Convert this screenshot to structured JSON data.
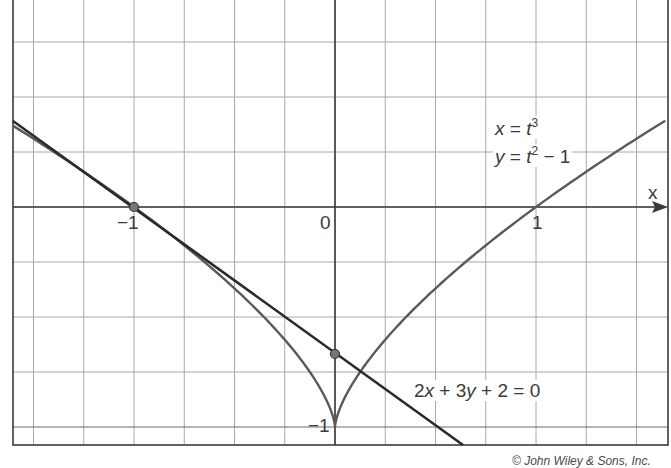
{
  "chart_data": {
    "type": "line",
    "title": "",
    "xlabel": "x",
    "ylabel": "y",
    "xlim": [
      -1.6,
      1.66
    ],
    "ylim": [
      -1.08,
      0.94
    ],
    "grid": true,
    "grid_step": {
      "x": 0.25,
      "y": 0.25
    },
    "tick_labels": {
      "x": [
        "-1",
        "0",
        "1"
      ],
      "y": [
        "-1"
      ]
    },
    "series": [
      {
        "name": "parametric curve",
        "label_lines": [
          "x = t^3",
          "y = t^2 - 1"
        ],
        "x_of_t": "t^3",
        "y_of_t": "t^2 - 1",
        "t_range": [
          -1.17,
          1.18
        ],
        "points": [
          [
            -1.6,
            0.37
          ],
          [
            -1.0,
            0.0
          ],
          [
            -0.5,
            -0.37
          ],
          [
            -0.125,
            -0.75
          ],
          [
            0.0,
            -1.0
          ],
          [
            0.125,
            -0.75
          ],
          [
            0.5,
            -0.37
          ],
          [
            1.0,
            0.0
          ],
          [
            1.66,
            0.4
          ]
        ]
      },
      {
        "name": "tangent line",
        "label": "2x + 3y + 2 = 0",
        "slope": -0.6667,
        "intercept": -0.6667,
        "points": [
          [
            -1.6,
            0.4
          ],
          [
            0.64,
            -1.08
          ]
        ]
      }
    ],
    "highlighted_points": [
      {
        "x": -1,
        "y": 0
      },
      {
        "x": 0,
        "y": -0.6667
      }
    ],
    "annotations": [
      "x = t³",
      "y = t² − 1",
      "2x + 3y + 2 = 0"
    ]
  },
  "labels": {
    "axis_x": "x",
    "tick_neg1": "−1",
    "tick_0": "0",
    "tick_1": "1",
    "tick_y_neg1": "−1",
    "eq1_lhs": "x",
    "eq1_mid": " = ",
    "eq1_var": "t",
    "eq1_exp": "3",
    "eq2_lhs": "y",
    "eq2_mid": " = ",
    "eq2_var": "t",
    "eq2_exp": "2",
    "eq2_tail": " − 1",
    "line_eq_a": "2",
    "line_eq_x": "x",
    "line_eq_b": " + 3",
    "line_eq_y": "y",
    "line_eq_c": " + 2 = 0",
    "copyright": "© John Wiley & Sons, Inc."
  },
  "colors": {
    "grid": "#9a9a9a",
    "axis": "#3a3a3a",
    "curve": "#555555",
    "tangent": "#2a2a2a",
    "point": "#555555"
  }
}
